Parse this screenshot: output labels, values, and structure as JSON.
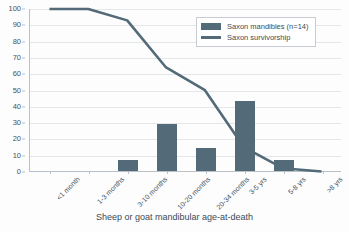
{
  "chart_data": {
    "type": "bar",
    "title": "",
    "xlabel": "Sheep or goat mandibular age-at-death",
    "ylabel": "",
    "ylim": [
      0,
      100
    ],
    "yticks": [
      0,
      10,
      20,
      30,
      40,
      50,
      60,
      70,
      80,
      90,
      100
    ],
    "grid": true,
    "legend_position": "top-right",
    "categories": [
      "<1 month",
      "1-3 months",
      "3-10 months",
      "10-20 months",
      "20-34 months",
      "3-5 yrs",
      "5-8 yrs",
      ">8 yrs"
    ],
    "series": [
      {
        "name": "Saxon mandibles (n=14)",
        "type": "bar",
        "color": "#536a79",
        "values": [
          0,
          0,
          7,
          29,
          14,
          43,
          7,
          0
        ]
      },
      {
        "name": "Saxon survivorship",
        "type": "line",
        "color": "#536a79",
        "values": [
          100,
          100,
          93,
          64,
          50,
          15,
          2,
          0
        ]
      }
    ]
  },
  "legend": {
    "entries": [
      {
        "label": "Saxon mandibles (n=14)"
      },
      {
        "label": "Saxon survivorship"
      }
    ]
  },
  "axis_title": "Sheep or goat mandibular age-at-death",
  "colors": {
    "series": "#536a79",
    "grid": "#e4e7ea",
    "axis": "#b9c0c6",
    "text": "#3c4b57"
  }
}
